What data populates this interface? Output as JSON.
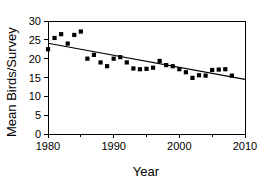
{
  "chart_data": {
    "type": "scatter",
    "title": "",
    "xlabel": "Year",
    "ylabel": "Mean Birds/Survey",
    "xlim": [
      1980,
      2010
    ],
    "ylim": [
      0,
      30
    ],
    "xticks": [
      1980,
      1990,
      2000,
      2010
    ],
    "xtick_labels": [
      "1980",
      "1990",
      "2000",
      "2010"
    ],
    "xminorticks": [
      1985,
      1995,
      2005
    ],
    "yticks": [
      0,
      5,
      10,
      15,
      20,
      25,
      30
    ],
    "ytick_labels": [
      "0",
      "5",
      "10",
      "15",
      "20",
      "25",
      "30"
    ],
    "grid": false,
    "legend": null,
    "marker": "square",
    "marker_color": "#000000",
    "x": [
      1980,
      1981,
      1982,
      1983,
      1984,
      1985,
      1986,
      1987,
      1988,
      1989,
      1990,
      1991,
      1992,
      1993,
      1994,
      1995,
      1996,
      1997,
      1998,
      1999,
      2000,
      2001,
      2002,
      2003,
      2004,
      2005,
      2006,
      2007,
      2008
    ],
    "values": [
      22.5,
      25.5,
      26.5,
      24.0,
      26.3,
      27.2,
      20.0,
      21.0,
      19.0,
      18.0,
      20.0,
      20.4,
      19.0,
      17.4,
      17.2,
      17.3,
      17.6,
      19.4,
      18.3,
      18.0,
      17.2,
      16.4,
      14.9,
      15.6,
      15.5,
      17.0,
      17.1,
      17.2,
      15.5
    ],
    "trendline": {
      "type": "linear",
      "x": [
        1980,
        2010
      ],
      "y": [
        24.1,
        14.5
      ]
    }
  },
  "annotations": {
    "x_axis_title": "Year",
    "y_axis_title": "Mean Birds/Survey"
  }
}
